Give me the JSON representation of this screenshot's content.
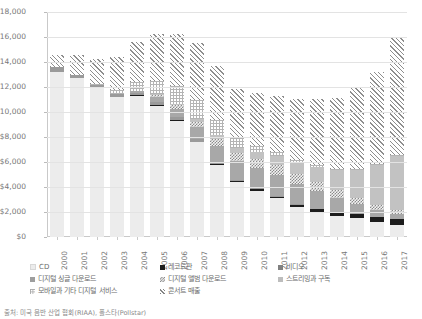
{
  "chart_data": {
    "type": "bar",
    "subtype": "stacked-bar",
    "title": "",
    "xlabel": "",
    "ylabel": "",
    "ylim": [
      0,
      18000
    ],
    "ytick_values": [
      0,
      2000,
      4000,
      6000,
      8000,
      10000,
      12000,
      14000,
      16000,
      18000
    ],
    "ytick_labels": [
      "$0",
      "$2,000",
      "$4,000",
      "$6,000",
      "$8,000",
      "$10,000",
      "$12,000",
      "$14,000",
      "$16,000",
      "$18,000"
    ],
    "grid": true,
    "legend_position": "bottom",
    "categories": [
      "2000",
      "2001",
      "2002",
      "2003",
      "2004",
      "2005",
      "2006",
      "2007",
      "2008",
      "2009",
      "2010",
      "2011",
      "2012",
      "2013",
      "2014",
      "2015",
      "2016",
      "2017"
    ],
    "series": [
      {
        "name": "CD",
        "key": "cd",
        "pattern": "solid-light-gray",
        "color": "#ececec",
        "values": [
          13200,
          12700,
          11900,
          11200,
          11300,
          10500,
          9300,
          7600,
          5800,
          4400,
          3700,
          3100,
          2400,
          2000,
          1700,
          1500,
          1200,
          1000
        ]
      },
      {
        "name": "레코드판",
        "key": "vinyl",
        "pattern": "solid-black",
        "color": "#1c1c1c",
        "values": [
          30,
          30,
          30,
          30,
          30,
          30,
          30,
          40,
          60,
          90,
          110,
          140,
          180,
          220,
          260,
          320,
          380,
          430
        ]
      },
      {
        "name": "비디오",
        "key": "video",
        "pattern": "solid-dark-gray",
        "color": "#9a9a9a",
        "values": [
          350,
          250,
          200,
          200,
          200,
          300,
          250,
          200,
          150,
          100,
          80,
          60,
          50,
          40,
          30,
          30,
          25,
          20
        ]
      },
      {
        "name": "디지털 싱글 다운로드",
        "key": "digital_single_download",
        "pattern": "solid-medium-gray",
        "color": "#a8a8a8",
        "values": [
          0,
          0,
          0,
          30,
          120,
          400,
          700,
          1000,
          1300,
          1500,
          1600,
          1700,
          1600,
          1400,
          1100,
          800,
          550,
          400
        ]
      },
      {
        "name": "디지털 앨범 다운로드",
        "key": "digital_album_download",
        "pattern": "checkered",
        "color": "#8a8a8a",
        "values": [
          0,
          0,
          0,
          10,
          40,
          120,
          250,
          400,
          550,
          650,
          750,
          800,
          800,
          750,
          650,
          500,
          380,
          300
        ]
      },
      {
        "name": "스트리밍과 구독",
        "key": "streaming_subscription",
        "pattern": "solid-gray",
        "color": "#c2c2c2",
        "values": [
          0,
          0,
          0,
          0,
          20,
          60,
          120,
          200,
          300,
          420,
          550,
          700,
          900,
          1200,
          1600,
          2200,
          3200,
          4300
        ]
      },
      {
        "name": "모바일과 기타 디지털 서비스",
        "key": "mobile_other_digital",
        "pattern": "grid-dotted",
        "color": "#b4b4b4",
        "values": [
          0,
          0,
          100,
          300,
          700,
          1100,
          1400,
          1500,
          1200,
          800,
          500,
          300,
          200,
          150,
          120,
          100,
          90,
          80
        ]
      },
      {
        "name": "콘서트 매출",
        "key": "concert_revenue",
        "pattern": "diagonal-hatch",
        "color": "#8e8e8e",
        "values": [
          1000,
          1600,
          2000,
          2600,
          3200,
          3700,
          4200,
          4600,
          4300,
          3900,
          4200,
          4500,
          4900,
          5300,
          5700,
          6500,
          7400,
          9400
        ]
      }
    ],
    "totals": [
      14580,
      14580,
      14230,
      14370,
      15610,
      16210,
      16250,
      15540,
      13660,
      11860,
      11490,
      11300,
      11030,
      11060,
      11160,
      11950,
      13225,
      15930
    ]
  },
  "legend": {
    "rows": [
      [
        {
          "label": "CD",
          "key": "cd"
        },
        {
          "label": "레코드판",
          "key": "vinyl"
        },
        {
          "label": "비디오",
          "key": "video"
        }
      ],
      [
        {
          "label": "디지털 싱글 다운로드",
          "key": "digital_single_download"
        },
        {
          "label": "디지털 앨범 다운로드",
          "key": "digital_album_download"
        },
        {
          "label": "스트리밍과 구독",
          "key": "streaming_subscription"
        }
      ],
      [
        {
          "label": "모바일과 기타 디지털 서비스",
          "key": "mobile_other_digital"
        },
        {
          "label": "콘서트 매출",
          "key": "concert_revenue"
        }
      ]
    ]
  },
  "caption": {
    "text": "출처: 미국 음반 산업 협회(RIAA), 폴스타(Pollstar)"
  }
}
